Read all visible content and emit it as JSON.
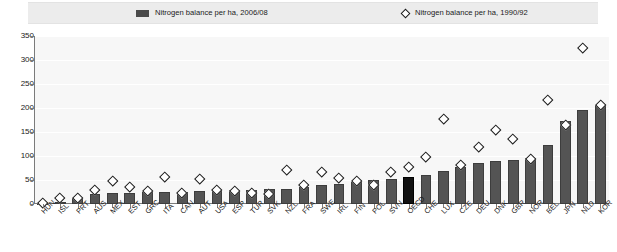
{
  "legend": {
    "bars_label": "Nitrogen balance per ha, 2006/08",
    "markers_label": "Nitrogen balance per ha, 1990/92",
    "bar_swatch_icon": "filled-rectangle-swatch",
    "marker_swatch_icon": "open-diamond-swatch"
  },
  "colors": {
    "bar": "#545454",
    "bar_highlight": "#111111",
    "marker_fill": "#ffffff",
    "marker_stroke": "#1a1a1a",
    "plot_background": "#f7f7f7",
    "legend_background": "#ececec",
    "axis": "#7b7b7b",
    "gridline": "#ffffff"
  },
  "chart_data": {
    "type": "bar",
    "title": "",
    "subtitle": "",
    "xlabel": "",
    "ylabel": "",
    "ylim": [
      0,
      350
    ],
    "yticks": [
      0,
      50,
      100,
      150,
      200,
      250,
      300,
      350
    ],
    "grid": true,
    "legend_position": "top",
    "highlight_category": "OECD",
    "categories": [
      "HUN",
      "ISL",
      "PRT",
      "AUS",
      "MEX",
      "EST",
      "GRC",
      "ITA",
      "CAN",
      "AUT",
      "USA",
      "ESP",
      "TUR",
      "SVK",
      "NZL",
      "FRA",
      "SWE",
      "IRL",
      "FIN",
      "POL",
      "SVN",
      "OECD",
      "CHE",
      "LUX",
      "CZE",
      "DEU",
      "DNK",
      "GBR",
      "NOR",
      "BEL",
      "JPN",
      "NLD",
      "KOR"
    ],
    "series": [
      {
        "name": "Nitrogen balance per ha, 2006/08",
        "type": "bar",
        "values": [
          1,
          5,
          12,
          20,
          22,
          22,
          24,
          26,
          26,
          28,
          29,
          30,
          30,
          32,
          32,
          35,
          40,
          42,
          45,
          50,
          52,
          56,
          60,
          68,
          78,
          86,
          90,
          92,
          95,
          122,
          172,
          196,
          206
        ]
      },
      {
        "name": "Nitrogen balance per ha, 1990/92",
        "type": "scatter",
        "marker": "open-diamond",
        "values": [
          2,
          12,
          14,
          30,
          48,
          35,
          28,
          56,
          24,
          52,
          29,
          28,
          24,
          22,
          72,
          40,
          68,
          55,
          48,
          40,
          68,
          78,
          98,
          178,
          82,
          120,
          155,
          135,
          95,
          218,
          165,
          325,
          207
        ]
      }
    ]
  }
}
